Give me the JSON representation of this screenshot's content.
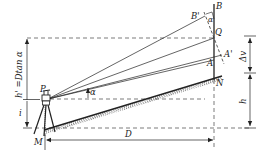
{
  "diagram": {
    "type": "trigonometric-leveling",
    "labels": {
      "B": "B",
      "B_prime": "B'",
      "Q": "Q",
      "A_prime": "A'",
      "A": "A",
      "N": "N",
      "P": "P",
      "M": "M",
      "alpha": "α",
      "alpha_small": "α",
      "D": "D",
      "i": "i",
      "h": "h",
      "delta_v": "Δv",
      "h_prime": "h' =Dtan α"
    },
    "colors": {
      "line": "#222222",
      "dashed": "#444444"
    }
  }
}
